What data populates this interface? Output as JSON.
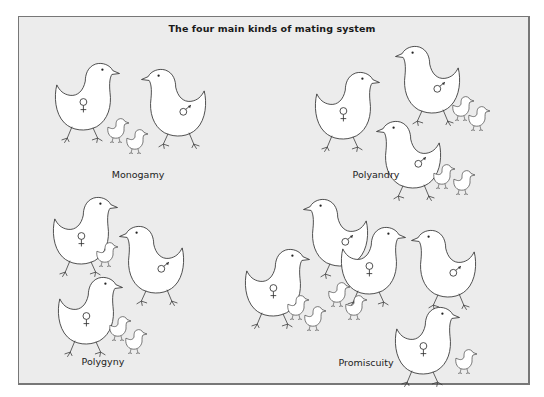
{
  "title": "The four main kinds of mating system",
  "colors": {
    "background": "#ececec",
    "border": "#777777",
    "bird_fill": "#ffffff",
    "stroke": "#333333"
  },
  "symbols": {
    "female": "♀",
    "male": "♂"
  },
  "panels": [
    {
      "id": "monogamy",
      "label": "Monogamy",
      "females": 1,
      "males": 1,
      "chicks": 2,
      "description": "One female and one male with two chicks"
    },
    {
      "id": "polyandry",
      "label": "Polyandry",
      "females": 1,
      "males": 2,
      "chicks": 4,
      "description": "One female with two males, each male accompanied by two chicks"
    },
    {
      "id": "polygyny",
      "label": "Polygyny",
      "females": 2,
      "males": 1,
      "chicks": 3,
      "description": "One male with two females, females accompanied by chicks"
    },
    {
      "id": "promiscuity",
      "label": "Promiscuity",
      "females": 3,
      "males": 2,
      "chicks": 5,
      "description": "Several females and males mixed, with chicks"
    }
  ]
}
